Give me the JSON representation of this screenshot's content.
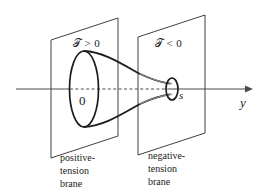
{
  "figure": {
    "background_color": "#ffffff",
    "line_color": "#1a1a1a",
    "gray_line_color": "#8f8f8f",
    "width": 267,
    "height": 196
  },
  "axis": {
    "label": "y",
    "origin_label": "0",
    "second_point_label": "s",
    "style": "solid-with-dashed-middle-segment",
    "arrow": "right-arrowhead"
  },
  "branes": [
    {
      "id": "positive",
      "tension_symbol": "𝒯",
      "tension_relation": "> 0",
      "tension_label": "𝒯 > 0",
      "caption_lines": [
        "positive-",
        "tension",
        "brane"
      ],
      "throat_end": "wide"
    },
    {
      "id": "negative",
      "tension_symbol": "𝒯",
      "tension_relation": "< 0",
      "tension_label": "𝒯 < 0",
      "caption_lines": [
        "negative-",
        "tension",
        "brane"
      ],
      "throat_end": "narrow"
    }
  ],
  "shapes": {
    "left_plane": "parallelogram",
    "right_plane": "parallelogram",
    "left_ellipse": "large-vertical-ellipse",
    "right_ellipse": "small-vertical-ellipse",
    "connector": "funnel-throat"
  }
}
